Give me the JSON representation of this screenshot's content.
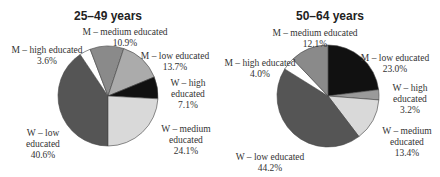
{
  "chart_data": [
    {
      "type": "pie",
      "title": "25–49 years",
      "start_angle_deg": 180,
      "center": [
        108,
        96
      ],
      "radius": 50,
      "slices": [
        {
          "label": "W – low educated",
          "value": 40.6,
          "color": "#555555"
        },
        {
          "label": "M – high educated",
          "value": 3.6,
          "color": "#ffffff"
        },
        {
          "label": "M – medium educated",
          "value": 10.9,
          "color": "#8a8a8a"
        },
        {
          "label": "M – low educated",
          "value": 13.7,
          "color": "#ababab"
        },
        {
          "label": "W – high educated",
          "value": 7.1,
          "color": "#111111"
        },
        {
          "label": "W – medium educated",
          "value": 24.1,
          "color": "#d9d9d9"
        }
      ]
    },
    {
      "type": "pie",
      "title": "50–64 years",
      "start_angle_deg": 0,
      "center": [
        108,
        96
      ],
      "radius": 51,
      "slices": [
        {
          "label": "M – low educated",
          "value": 23.0,
          "color": "#111111"
        },
        {
          "label": "W – high educated",
          "value": 3.2,
          "color": "#9a9a9a"
        },
        {
          "label": "W – medium educated",
          "value": 13.4,
          "color": "#d9d9d9"
        },
        {
          "label": "W – low educated",
          "value": 44.2,
          "color": "#555555"
        },
        {
          "label": "M – high educated",
          "value": 4.0,
          "color": "#ffffff"
        },
        {
          "label": "M – medium educated",
          "value": 12.1,
          "color": "#8a8a8a"
        }
      ]
    }
  ],
  "labels": {
    "left": {
      "m_medium": [
        "M – medium educated",
        "10.9%"
      ],
      "m_high": [
        "M – high educated",
        "3.6%"
      ],
      "m_low": [
        "M – low educated",
        "13.7%"
      ],
      "w_high": [
        "W – high",
        "educated",
        "7.1%"
      ],
      "w_medium": [
        "W – medium",
        "educated",
        "24.1%"
      ],
      "w_low": [
        "W – low",
        "educated",
        "40.6%"
      ]
    },
    "right": {
      "m_medium": [
        "M – medium educated",
        "12.1%"
      ],
      "m_high": [
        "M – high educated",
        "4.0%"
      ],
      "m_low": [
        "M – low educated",
        "23.0%"
      ],
      "w_high": [
        "W – high",
        "educated",
        "3.2%"
      ],
      "w_medium": [
        "W – medium",
        "educated",
        "13.4%"
      ],
      "w_low": [
        "W – low educated",
        "44.2%"
      ]
    }
  }
}
